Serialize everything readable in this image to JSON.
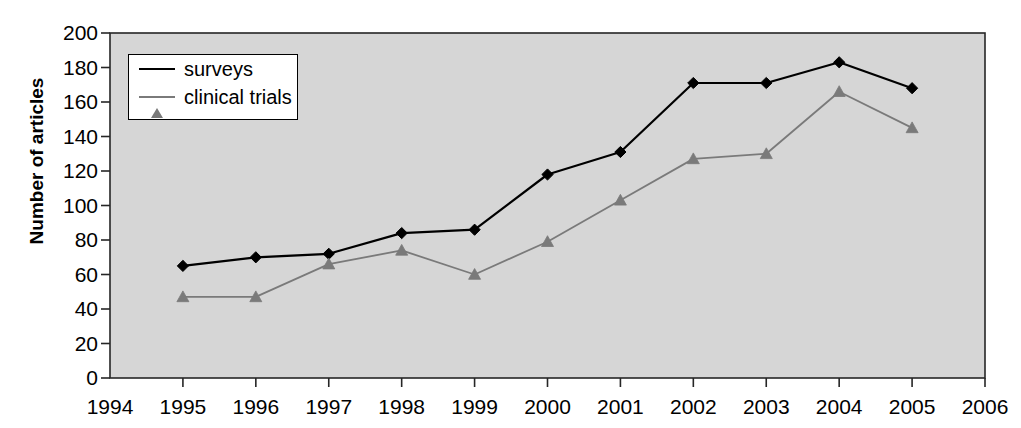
{
  "chart_data": {
    "type": "line",
    "title": "",
    "xlabel": "",
    "ylabel": "Number of articles",
    "grid": false,
    "legend_position": "top-left-inside",
    "background": "#d4d4d4",
    "x": [
      1994,
      1995,
      1996,
      1997,
      1998,
      1999,
      2000,
      2001,
      2002,
      2003,
      2004,
      2005,
      2006
    ],
    "xtick_labels": [
      "1994",
      "1995",
      "1996",
      "1997",
      "1998",
      "1999",
      "2000",
      "2001",
      "2002",
      "2003",
      "2004",
      "2005",
      "2006"
    ],
    "xlim": [
      1994,
      2006
    ],
    "ylim": [
      0,
      200
    ],
    "ytick_labels": [
      "0",
      "20",
      "40",
      "60",
      "80",
      "100",
      "120",
      "140",
      "160",
      "180",
      "200"
    ],
    "ytick_values": [
      0,
      20,
      40,
      60,
      80,
      100,
      120,
      140,
      160,
      180,
      200
    ],
    "series": [
      {
        "name": "surveys",
        "color": "#000000",
        "marker": "diamond",
        "x": [
          1995,
          1996,
          1997,
          1998,
          1999,
          2000,
          2001,
          2002,
          2003,
          2004,
          2005
        ],
        "values": [
          65,
          70,
          72,
          84,
          86,
          118,
          131,
          171,
          171,
          183,
          168
        ]
      },
      {
        "name": "clinical trials",
        "color": "#7a7a7a",
        "marker": "triangle",
        "x": [
          1995,
          1996,
          1997,
          1998,
          1999,
          2000,
          2001,
          2002,
          2003,
          2004,
          2005
        ],
        "values": [
          47,
          47,
          66,
          74,
          60,
          79,
          103,
          127,
          130,
          166,
          145
        ]
      }
    ]
  },
  "legend": {
    "items": [
      {
        "label": "surveys"
      },
      {
        "label": "clinical trials"
      }
    ]
  },
  "axes": {
    "y_axis_title": "Number of articles"
  }
}
